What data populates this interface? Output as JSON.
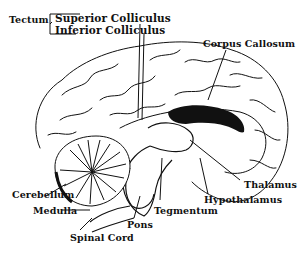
{
  "diagram": {
    "line_color": "#111111",
    "background": "#ffffff",
    "labels": {
      "tectum": "Tectum",
      "superior_colliculus": "Superior Colliculus",
      "inferior_colliculus": "Inferior Colliculus",
      "corpus_callosum": "Corpus Callosum",
      "cerebellum": "Cerebellum",
      "medulla": "Medulla",
      "pons": "Pons",
      "spinal_cord": "Spinal Cord",
      "tegmentum": "Tegmentum",
      "hypothalamus": "Hypothalamus",
      "thalamus": "Thalamus"
    }
  }
}
